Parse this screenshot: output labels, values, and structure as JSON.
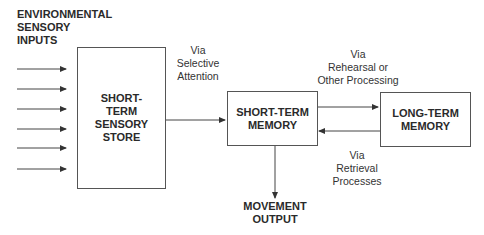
{
  "diagram": {
    "inputs_label": "ENVIRONMENTAL\nSENSORY\nINPUTS",
    "input_arrow_count": 6,
    "nodes": {
      "sensory_store": "SHORT-\nTERM\nSENSORY\nSTORE",
      "short_term_memory": "SHORT-TERM\nMEMORY",
      "long_term_memory": "LONG-TERM\nMEMORY",
      "movement_output": "MOVEMENT\nOUTPUT"
    },
    "edge_labels": {
      "selective_attention": "Via\nSelective\nAttention",
      "rehearsal": "Via\nRehearsal or\nOther Processing",
      "retrieval": "Via\nRetrieval\nProcesses"
    },
    "colors": {
      "line": "#444444",
      "text": "#2a2a2a",
      "background": "#ffffff"
    }
  }
}
